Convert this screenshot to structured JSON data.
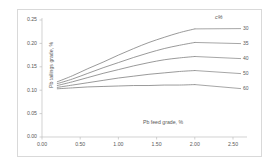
{
  "chart_data": {
    "type": "line",
    "title": "",
    "xlabel": "Pb feed grade, %",
    "ylabel": "Pb tailings grade, %",
    "xlim": [
      0.0,
      2.5
    ],
    "ylim": [
      0.0,
      0.25
    ],
    "xticks": [
      "0.00",
      "0.50",
      "1.00",
      "1.50",
      "2.00",
      "2.50"
    ],
    "yticks": [
      "0.00",
      "0.05",
      "0.10",
      "0.15",
      "0.20",
      "0.25"
    ],
    "grid": false,
    "legend_position": "right",
    "legend_title": "c%",
    "line_color": "#808080",
    "x": [
      0.2,
      0.4,
      0.6,
      0.8,
      1.0,
      1.2,
      1.4,
      1.6,
      1.8,
      2.0
    ],
    "series": [
      {
        "name": "30",
        "values": [
          0.118,
          0.131,
          0.146,
          0.16,
          0.175,
          0.189,
          0.202,
          0.213,
          0.223,
          0.231
        ]
      },
      {
        "name": "35",
        "values": [
          0.114,
          0.124,
          0.136,
          0.148,
          0.159,
          0.17,
          0.18,
          0.189,
          0.196,
          0.202
        ]
      },
      {
        "name": "40",
        "values": [
          0.11,
          0.118,
          0.127,
          0.136,
          0.144,
          0.152,
          0.159,
          0.165,
          0.169,
          0.172
        ]
      },
      {
        "name": "50",
        "values": [
          0.106,
          0.111,
          0.116,
          0.121,
          0.126,
          0.13,
          0.134,
          0.137,
          0.14,
          0.142
        ]
      },
      {
        "name": "60",
        "values": [
          0.103,
          0.105,
          0.107,
          0.108,
          0.109,
          0.11,
          0.11,
          0.111,
          0.111,
          0.112
        ]
      }
    ]
  },
  "axes": {
    "x_title": "Pb feed grade, %",
    "y_title": "Pb tailings grade, %",
    "x_tick_0": "0.00",
    "x_tick_1": "0.50",
    "x_tick_2": "1.00",
    "x_tick_3": "1.50",
    "x_tick_4": "2.00",
    "x_tick_5": "2.50",
    "y_tick_0": "0.00",
    "y_tick_1": "0.05",
    "y_tick_2": "0.10",
    "y_tick_3": "0.15",
    "y_tick_4": "0.20",
    "y_tick_5": "0.25"
  },
  "legend": {
    "title": "c%",
    "items": [
      {
        "label": "30"
      },
      {
        "label": "35"
      },
      {
        "label": "40"
      },
      {
        "label": "50"
      },
      {
        "label": "60"
      }
    ]
  }
}
